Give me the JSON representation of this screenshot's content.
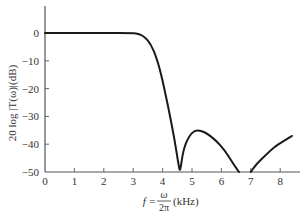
{
  "chart_data": {
    "type": "line",
    "title": "",
    "xlabel": "f = ω/2π (kHz)",
    "xlabel_parts": {
      "lhs": "f =",
      "num": "ω",
      "den": "2π",
      "unit": "(kHz)"
    },
    "ylabel": "20 log |T(ω)|(dB)",
    "xlim": [
      0,
      8.8
    ],
    "ylim": [
      -50,
      10
    ],
    "x_ticks": [
      0,
      1,
      2,
      3,
      4,
      5,
      6,
      7,
      8
    ],
    "y_ticks": [
      0,
      -10,
      -20,
      -30,
      -40,
      -50
    ],
    "grid": false,
    "legend": null,
    "series": [
      {
        "name": "20 log |T(ω)|",
        "color": "#1a1a1a",
        "x": [
          0,
          1,
          2,
          3.0,
          3.2,
          3.4,
          3.6,
          3.8,
          4.0,
          4.2,
          4.4,
          4.55,
          4.6,
          4.7,
          4.9,
          5.1,
          5.3,
          5.5,
          5.8,
          6.1,
          6.4,
          6.6,
          7.0,
          7.2,
          7.5,
          7.8,
          8.1,
          8.4
        ],
        "y": [
          0,
          0,
          0,
          0,
          -0.3,
          -1.5,
          -4,
          -9,
          -17,
          -27,
          -38,
          -48,
          -50,
          -42,
          -37,
          -35,
          -35.2,
          -36,
          -38.5,
          -42,
          -47,
          -50,
          -50,
          -47,
          -44,
          -41,
          -39,
          -37
        ]
      }
    ],
    "annotations": []
  }
}
